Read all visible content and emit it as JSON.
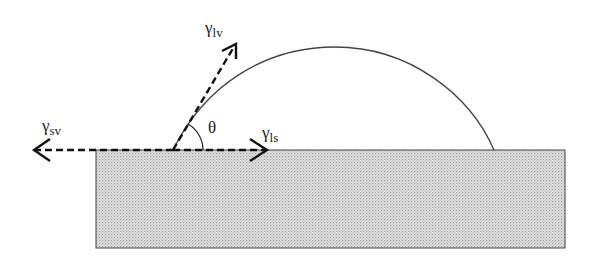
{
  "diagram": {
    "type": "contact-angle / Young's equation",
    "labels": {
      "gamma_lv": {
        "symbol": "γ",
        "subscript": "lv"
      },
      "gamma_sv": {
        "symbol": "γ",
        "subscript": "sv"
      },
      "gamma_ls": {
        "symbol": "γ",
        "subscript": "ls"
      },
      "theta": "θ"
    },
    "elements": {
      "substrate": "solid surface (stippled)",
      "droplet": "liquid drop profile",
      "vectors": [
        "gamma_lv",
        "gamma_sv",
        "gamma_ls"
      ]
    },
    "colors": {
      "line": "#333333",
      "substrate_fill": "#d9d9d9",
      "substrate_dot": "#a8a8a8"
    }
  }
}
